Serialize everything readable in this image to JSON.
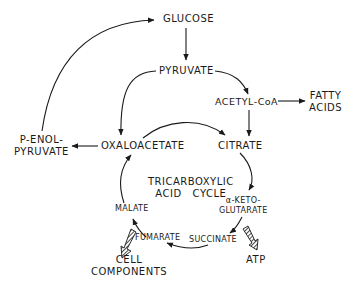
{
  "diagram": {
    "nodes": {
      "glucose": "GLUCOSE",
      "pyruvate": "PYRUVATE",
      "acetyl_coa": "ACETYL-CoA",
      "fatty_acids_line1": "FATTY",
      "fatty_acids_line2": "ACIDS",
      "p_enol_line1": "P-ENOL-",
      "p_enol_line2": "PYRUVATE",
      "oxaloacetate": "OXALOACETATE",
      "citrate": "CITRATE",
      "cycle_line1": "TRICARBOXYLIC",
      "cycle_line2": "ACID   CYCLE",
      "alpha_keto_line1": "α-KETO-",
      "alpha_keto_line2": "GLUTARATE",
      "malate": "MALATE",
      "fumarate": "FUMARATE",
      "succinate": "SUCCINATE",
      "cell_components_line1": "CELL",
      "cell_components_line2": "COMPONENTS",
      "atp": "ATP"
    },
    "edges": [
      {
        "from": "GLUCOSE",
        "to": "PYRUVATE"
      },
      {
        "from": "PYRUVATE",
        "to": "ACETYL-CoA"
      },
      {
        "from": "PYRUVATE",
        "to": "OXALOACETATE"
      },
      {
        "from": "ACETYL-CoA",
        "to": "FATTY ACIDS"
      },
      {
        "from": "ACETYL-CoA",
        "to": "CITRATE"
      },
      {
        "from": "OXALOACETATE",
        "to": "CITRATE"
      },
      {
        "from": "OXALOACETATE",
        "to": "P-ENOL-PYRUVATE"
      },
      {
        "from": "P-ENOL-PYRUVATE",
        "to": "GLUCOSE"
      },
      {
        "from": "CITRATE",
        "to": "α-KETO-GLUTARATE"
      },
      {
        "from": "α-KETO-GLUTARATE",
        "to": "SUCCINATE"
      },
      {
        "from": "α-KETO-GLUTARATE",
        "to": "ATP",
        "style": "hatched"
      },
      {
        "from": "SUCCINATE",
        "to": "FUMARATE"
      },
      {
        "from": "FUMARATE",
        "to": "MALATE"
      },
      {
        "from": "FUMARATE",
        "to": "CELL COMPONENTS",
        "style": "hatched"
      },
      {
        "from": "MALATE",
        "to": "OXALOACETATE"
      }
    ]
  }
}
